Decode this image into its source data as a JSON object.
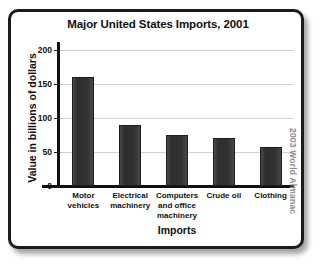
{
  "chart_data": {
    "type": "bar",
    "title": "Major United States Imports, 2001",
    "xlabel": "Imports",
    "ylabel": "Value in billions of dollars",
    "categories": [
      "Motor vehicles",
      "Electrical machinery",
      "Computers and office machinery",
      "Crude oil",
      "Clothing"
    ],
    "category_lines": [
      [
        "Motor",
        "vehicles"
      ],
      [
        "Electrical",
        "machinery"
      ],
      [
        "Computers",
        "and office",
        "machinery"
      ],
      [
        "Crude oil"
      ],
      [
        "Clothing"
      ]
    ],
    "values": [
      160,
      90,
      75,
      70,
      57
    ],
    "ylim": [
      0,
      215
    ],
    "yticks": [
      0,
      50,
      100,
      150,
      200
    ],
    "ytick_labels": [
      "0",
      "50",
      "100",
      "150",
      "200"
    ],
    "grid": true,
    "legend": false,
    "units": "billions of dollars"
  },
  "source": {
    "credit": "2003 World Almanac"
  },
  "colors": {
    "bar": "#333333",
    "axis": "#111111",
    "gridline": "#d2d2d2",
    "frame": "#1b1b1b",
    "background": "#ffffff",
    "credit_text": "#8c8c8c"
  }
}
